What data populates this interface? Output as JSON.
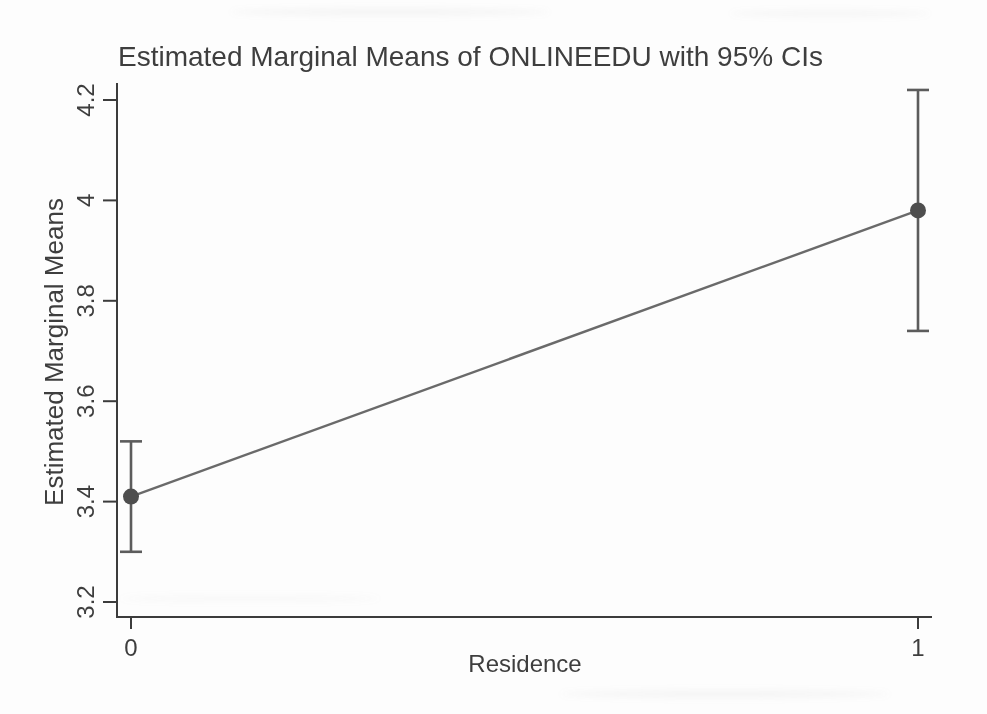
{
  "page": {
    "background_color": "#fdfdfd"
  },
  "chart_data": {
    "type": "line",
    "title": "Estimated Marginal Means of ONLINEEDU with 95% CIs",
    "xlabel": "Residence",
    "ylabel": "Estimated Marginal Means",
    "categories": [
      "0",
      "1"
    ],
    "x": [
      0,
      1
    ],
    "series": [
      {
        "name": "Estimated Marginal Mean",
        "values": [
          3.41,
          3.98
        ],
        "ci_low": [
          3.3,
          3.74
        ],
        "ci_high": [
          3.52,
          4.22
        ]
      }
    ],
    "y_ticks": [
      3.2,
      3.4,
      3.6,
      3.8,
      4.0,
      4.2
    ],
    "y_tick_labels": [
      "3.2",
      "3.4",
      "3.6",
      "3.8",
      "4",
      "4.2"
    ],
    "ylim": [
      3.17,
      4.23
    ],
    "grid": false,
    "legend": "none",
    "marker": "circle-with-error-bars",
    "colors": {
      "text": "#3e3e3e",
      "axis": "#3c3c3c",
      "line": "#6a6a6a",
      "marker": "#4e4e4e",
      "error_bar": "#5c5c5c"
    }
  }
}
